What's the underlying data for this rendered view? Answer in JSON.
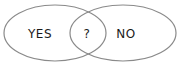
{
  "diagram": {
    "type": "venn",
    "sets": [
      {
        "label": "YES",
        "center_x": 55,
        "center_y": 33,
        "rx": 51,
        "ry": 28
      },
      {
        "label": "NO",
        "center_x": 123,
        "center_y": 33,
        "rx": 53,
        "ry": 28
      }
    ],
    "intersection": {
      "label": "?"
    },
    "colors": {
      "outline": "#8a8a8a",
      "fill": "#ffffff",
      "text": "#1a1a1a"
    }
  }
}
